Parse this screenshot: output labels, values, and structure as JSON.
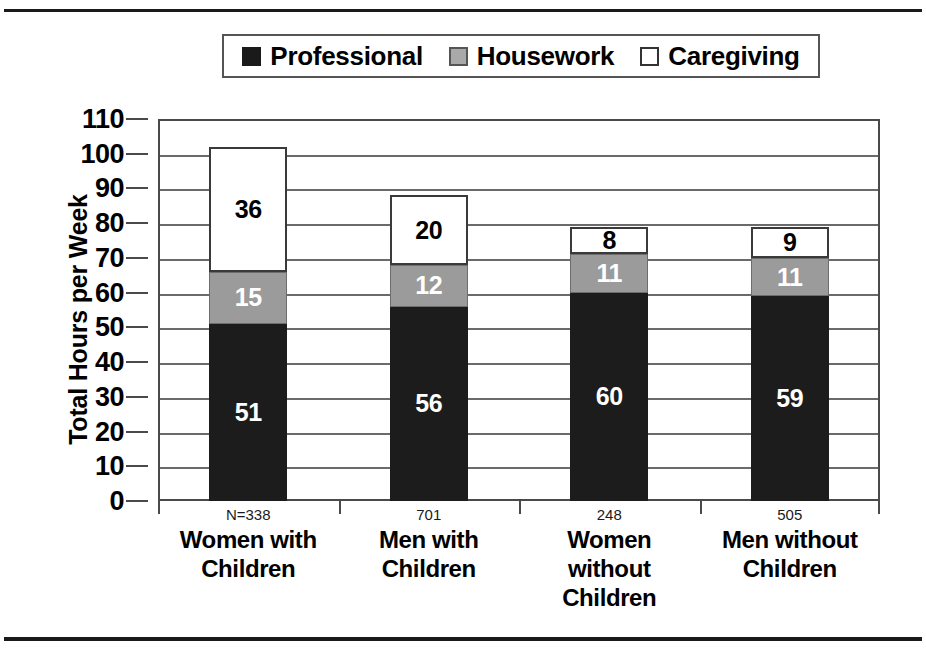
{
  "chart_data": {
    "type": "bar",
    "stacked": true,
    "title": "",
    "xlabel": "",
    "ylabel": "Total Hours per Week",
    "ylim": [
      0,
      110
    ],
    "ytick_step": 10,
    "yticks": [
      "110",
      "100",
      "90",
      "80",
      "70",
      "60",
      "50",
      "40",
      "30",
      "20",
      "10",
      "0"
    ],
    "grid": true,
    "legend_position": "top-center",
    "categories": [
      "Women with Children",
      "Men with Children",
      "Women without Children",
      "Men without Children"
    ],
    "category_lines": [
      [
        "Women with",
        "Children"
      ],
      [
        "Men with",
        "Children"
      ],
      [
        "Women",
        "without",
        "Children"
      ],
      [
        "Men without",
        "Children"
      ]
    ],
    "sample_sizes": [
      "N=338",
      "701",
      "248",
      "505"
    ],
    "series": [
      {
        "name": "Professional",
        "color": "#1c1c1c",
        "values": [
          51,
          56,
          60,
          59
        ]
      },
      {
        "name": "Housework",
        "color": "#9b9b9b",
        "values": [
          15,
          12,
          11,
          11
        ]
      },
      {
        "name": "Caregiving",
        "color": "#ffffff",
        "values": [
          36,
          20,
          8,
          9
        ]
      }
    ],
    "totals": [
      102,
      88,
      79,
      79
    ]
  },
  "legend": {
    "items": [
      {
        "label": "Professional",
        "swatch": "black-square-swatch"
      },
      {
        "label": "Housework",
        "swatch": "gray-square-swatch"
      },
      {
        "label": "Caregiving",
        "swatch": "white-square-swatch"
      }
    ]
  }
}
